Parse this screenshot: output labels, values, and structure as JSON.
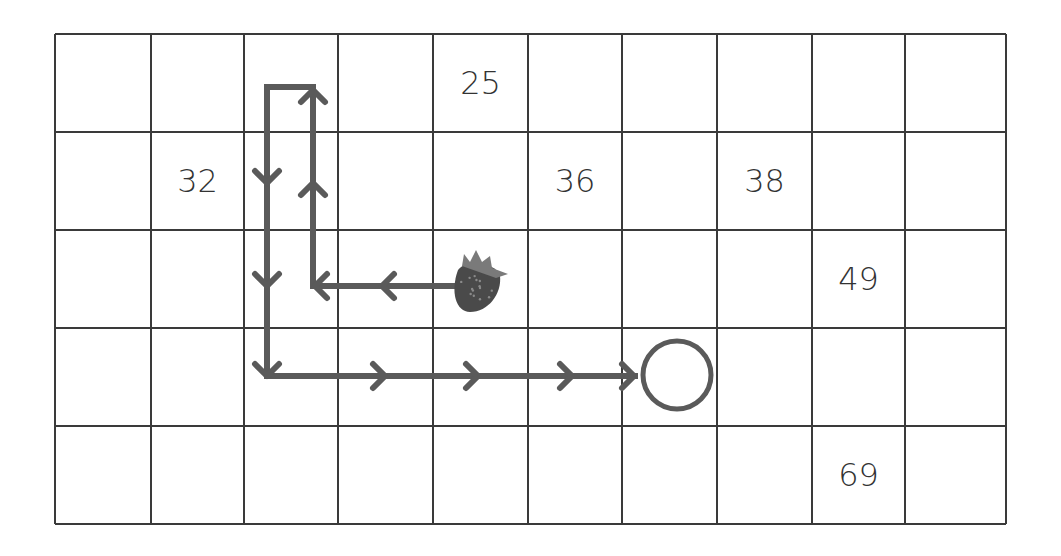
{
  "grid": {
    "rows": 5,
    "cols": 10,
    "col_x": [
      55,
      151,
      244,
      338,
      433,
      528,
      622,
      717,
      812,
      905,
      1006
    ],
    "row_y": [
      34,
      132,
      230,
      328,
      426,
      524
    ],
    "line_color": "#3a3a3a"
  },
  "cells": [
    {
      "row": 0,
      "col": 4,
      "label": "25"
    },
    {
      "row": 1,
      "col": 1,
      "label": "32"
    },
    {
      "row": 1,
      "col": 5,
      "label": "36"
    },
    {
      "row": 1,
      "col": 7,
      "label": "38"
    },
    {
      "row": 2,
      "col": 8,
      "label": "49"
    },
    {
      "row": 4,
      "col": 8,
      "label": "69"
    }
  ],
  "path": {
    "color": "#5a5a5a",
    "start_icon": "strawberry-icon",
    "end_icon": "circle-target-icon",
    "points": [
      [
        478,
        286
      ],
      [
        313,
        286
      ],
      [
        313,
        87
      ],
      [
        267,
        87
      ],
      [
        267,
        376
      ],
      [
        638,
        376
      ]
    ]
  },
  "strawberry": {
    "cx": 478,
    "cy": 282,
    "color": "#4a4a4a",
    "leaf_color": "#7a7a7a"
  },
  "target_circle": {
    "cx": 677,
    "cy": 375,
    "r": 34,
    "color": "#5a5a5a"
  }
}
